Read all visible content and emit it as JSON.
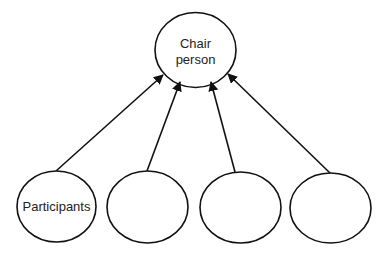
{
  "diagram": {
    "top_node": {
      "line1": "Chair",
      "line2": "person"
    },
    "bottom_nodes": [
      {
        "label": "Participants"
      },
      {
        "label": ""
      },
      {
        "label": ""
      },
      {
        "label": ""
      }
    ],
    "edge_direction": "bottom-to-top",
    "colors": {
      "stroke": "#111111",
      "background": "#ffffff"
    }
  }
}
